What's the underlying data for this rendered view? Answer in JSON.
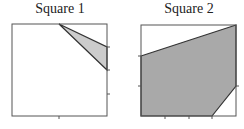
{
  "squares": [
    {
      "title": "Square 1",
      "box": {
        "x": 12,
        "y": 24,
        "w": 95,
        "h": 92
      },
      "polygon": [
        [
          59,
          24
        ],
        [
          107,
          47
        ],
        [
          107,
          70
        ]
      ],
      "right_ticks_y": [
        47,
        70,
        94
      ],
      "bottom_ticks_x": [
        59
      ]
    },
    {
      "title": "Square 2",
      "box": {
        "x": 141,
        "y": 25,
        "w": 95,
        "h": 91
      },
      "polygon": [
        [
          141,
          56
        ],
        [
          236,
          25
        ],
        [
          236,
          86
        ],
        [
          212,
          116
        ],
        [
          141,
          116
        ]
      ],
      "left_ticks_y": [
        56,
        86
      ],
      "right_ticks_y": [
        86
      ],
      "bottom_ticks_x": [
        165,
        189,
        212
      ]
    }
  ],
  "colors": {
    "fill1": "#cccccc",
    "fill2": "#a9a9a9",
    "stroke": "#333333"
  }
}
